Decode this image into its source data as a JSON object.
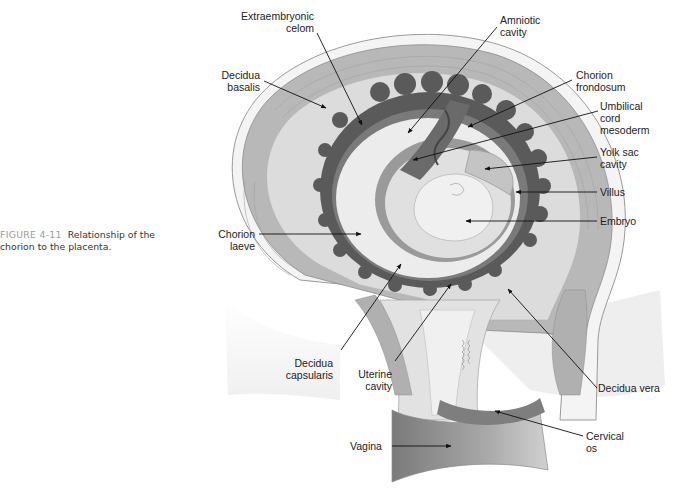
{
  "figure": {
    "number": "FIGURE 4-11",
    "caption": "Relationship of the chorion to the placenta."
  },
  "labels": [
    {
      "id": "extraembryonic-celom",
      "text": "Extraembryonic\ncelom"
    },
    {
      "id": "amniotic-cavity",
      "text": "Amniotic\ncavity"
    },
    {
      "id": "decidua-basalis",
      "text": "Decidua\nbasalis"
    },
    {
      "id": "chorion-frondosum",
      "text": "Chorion\nfrondosum"
    },
    {
      "id": "umbilical-cord-mesoderm",
      "text": "Umbilical\ncord\nmesoderm"
    },
    {
      "id": "yolk-sac-cavity",
      "text": "Yolk sac\ncavity"
    },
    {
      "id": "villus",
      "text": "Villus"
    },
    {
      "id": "embryo",
      "text": "Embryo"
    },
    {
      "id": "chorion-laeve",
      "text": "Chorion\nlaeve"
    },
    {
      "id": "decidua-capsularis",
      "text": "Decidua\ncapsularis"
    },
    {
      "id": "uterine-cavity",
      "text": "Uterine\ncavity"
    },
    {
      "id": "decidua-vera",
      "text": "Decidua vera"
    },
    {
      "id": "cervical-os",
      "text": "Cervical\nos"
    },
    {
      "id": "vagina",
      "text": "Vagina"
    }
  ],
  "colors": {
    "myometrium": "#b8b8b8",
    "decidua": "#dcdcdc",
    "chorion_dark": "#5a5a5a",
    "amnion": "#9a9a9a",
    "cavity_light": "#ececec",
    "outline": "#8c8c8c",
    "text": "#222222",
    "caption_label": "#9a9a9a"
  }
}
